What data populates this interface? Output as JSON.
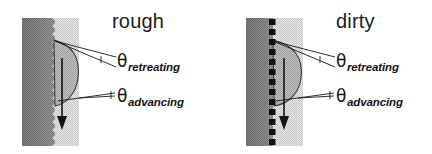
{
  "figure": {
    "width": 432,
    "height": 154,
    "background": "#ffffff"
  },
  "colors": {
    "solid_dark": "#7d7d7d",
    "liquid_light": "#d8d8d8",
    "droplet_fill": "#b4b4b4",
    "particle": "#111111",
    "line": "#1a1a1a",
    "text": "#141414"
  },
  "panels": [
    {
      "id": "rough",
      "title": "rough",
      "surface_type": "scalloped",
      "surface_description": "wavy scalloped solid-liquid interface",
      "arrow": {
        "direction": "down",
        "label": ""
      },
      "labels": [
        {
          "id": "retreating",
          "symbol": "θ",
          "subscript": "retreating"
        },
        {
          "id": "advancing",
          "symbol": "θ",
          "subscript": "advancing"
        }
      ]
    },
    {
      "id": "dirty",
      "title": "dirty",
      "surface_type": "particles",
      "surface_description": "flat interface decorated with contaminant particles",
      "particle_count": 13,
      "arrow": {
        "direction": "down",
        "label": ""
      },
      "labels": [
        {
          "id": "retreating",
          "symbol": "θ",
          "subscript": "retreating"
        },
        {
          "id": "advancing",
          "symbol": "θ",
          "subscript": "advancing"
        }
      ]
    }
  ]
}
